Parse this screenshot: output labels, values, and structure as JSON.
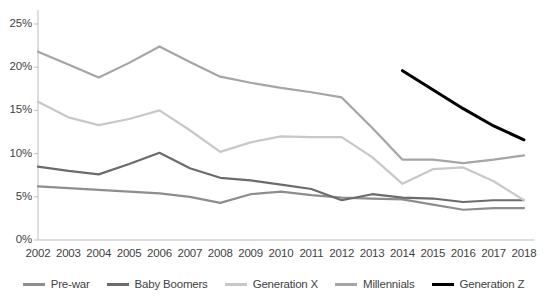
{
  "chart_data": {
    "type": "line",
    "title": "",
    "xlabel": "",
    "ylabel": "",
    "x": [
      2002,
      2003,
      2004,
      2005,
      2006,
      2007,
      2008,
      2009,
      2010,
      2011,
      2012,
      2013,
      2014,
      2015,
      2016,
      2017,
      2018
    ],
    "xticklabels": [
      "2002",
      "2003",
      "2004",
      "2005",
      "2006",
      "2007",
      "2008",
      "2009",
      "2010",
      "2011",
      "2012",
      "2013",
      "2014",
      "2015",
      "2016",
      "2017",
      "2018"
    ],
    "yticklabels": [
      "0%",
      "5%",
      "10%",
      "15%",
      "20%",
      "25%"
    ],
    "ytickvalues": [
      0,
      5,
      10,
      15,
      20,
      25
    ],
    "ylim": [
      0,
      25
    ],
    "grid": false,
    "legend_position": "bottom",
    "series": [
      {
        "name": "Pre-war",
        "color": "#8d8d8d",
        "values": [
          6.2,
          6.0,
          5.8,
          5.6,
          5.4,
          5.0,
          4.3,
          5.3,
          5.6,
          5.2,
          4.9,
          4.8,
          4.7,
          4.1,
          3.5,
          3.7,
          3.7
        ]
      },
      {
        "name": "Baby Boomers",
        "color": "#6b6b6b",
        "values": [
          8.5,
          8.0,
          7.6,
          8.8,
          10.1,
          8.3,
          7.2,
          6.9,
          6.4,
          5.9,
          4.6,
          5.3,
          4.9,
          4.8,
          4.4,
          4.6,
          4.6
        ]
      },
      {
        "name": "Generation X",
        "color": "#c8c8c8",
        "values": [
          16.0,
          14.2,
          13.3,
          14.0,
          15.0,
          12.7,
          10.2,
          11.3,
          12.0,
          11.9,
          11.9,
          9.6,
          6.5,
          8.2,
          8.4,
          6.8,
          4.6
        ]
      },
      {
        "name": "Millennials",
        "color": "#a5a5a5",
        "values": [
          21.8,
          20.3,
          18.8,
          20.5,
          22.4,
          20.6,
          18.9,
          18.2,
          17.6,
          17.1,
          16.5,
          13.0,
          9.3,
          9.3,
          8.9,
          9.3,
          9.8
        ]
      },
      {
        "name": "Generation Z",
        "color": "#000000",
        "values": [
          null,
          null,
          null,
          null,
          null,
          null,
          null,
          null,
          null,
          null,
          null,
          null,
          19.6,
          17.4,
          15.2,
          13.2,
          11.6
        ]
      }
    ]
  },
  "legend": {
    "items": [
      {
        "label": "Pre-war",
        "color": "#8d8d8d"
      },
      {
        "label": "Baby Boomers",
        "color": "#6b6b6b"
      },
      {
        "label": "Generation X",
        "color": "#c8c8c8"
      },
      {
        "label": "Millennials",
        "color": "#a5a5a5"
      },
      {
        "label": "Generation Z",
        "color": "#000000"
      }
    ]
  }
}
